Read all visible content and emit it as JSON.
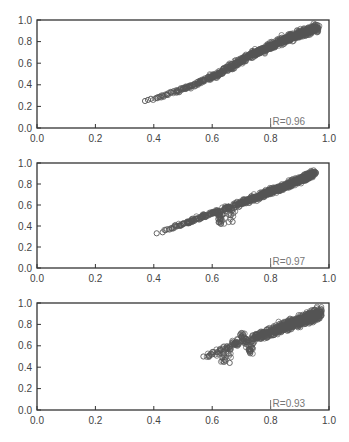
{
  "figure": {
    "panel_count": 3,
    "axis_color": "#333333",
    "marker_color": "#555555",
    "label_color": "#777777",
    "tick_color": "#333333"
  },
  "chart_data": [
    {
      "type": "scatter",
      "title": "",
      "xlabel": "",
      "ylabel": "",
      "xlim": [
        0.0,
        1.0
      ],
      "ylim": [
        0.0,
        1.0
      ],
      "x_ticks": [
        "0.0",
        "0.2",
        "0.4",
        "0.6",
        "0.8",
        "1.0"
      ],
      "y_ticks": [
        "0.0",
        "0.2",
        "0.4",
        "0.6",
        "0.8",
        "1.0"
      ],
      "grid": false,
      "legend": null,
      "marker": "open-circle",
      "annotation": "R=0.96",
      "correlation": 0.96,
      "trend": "curved (convex)",
      "x_range": [
        0.37,
        0.96
      ],
      "y_range": [
        0.25,
        0.93
      ],
      "series": [
        {
          "name": "points",
          "x": [
            0.37,
            0.38,
            0.39,
            0.41,
            0.42,
            0.43,
            0.44,
            0.46,
            0.48,
            0.5,
            0.52,
            0.54,
            0.55,
            0.57,
            0.59,
            0.6,
            0.62,
            0.64,
            0.65,
            0.67,
            0.68,
            0.7,
            0.71,
            0.72,
            0.74,
            0.75,
            0.76,
            0.78,
            0.79,
            0.8,
            0.82,
            0.83,
            0.85,
            0.86,
            0.88,
            0.89,
            0.9,
            0.92,
            0.93,
            0.95,
            0.96
          ],
          "y": [
            0.25,
            0.26,
            0.27,
            0.28,
            0.29,
            0.3,
            0.31,
            0.33,
            0.34,
            0.36,
            0.38,
            0.4,
            0.41,
            0.44,
            0.46,
            0.47,
            0.5,
            0.53,
            0.55,
            0.57,
            0.6,
            0.62,
            0.64,
            0.66,
            0.68,
            0.7,
            0.71,
            0.73,
            0.75,
            0.76,
            0.78,
            0.8,
            0.82,
            0.83,
            0.85,
            0.86,
            0.87,
            0.89,
            0.9,
            0.92,
            0.93
          ]
        }
      ]
    },
    {
      "type": "scatter",
      "title": "",
      "xlabel": "",
      "ylabel": "",
      "xlim": [
        0.0,
        1.0
      ],
      "ylim": [
        0.0,
        1.0
      ],
      "x_ticks": [
        "0.0",
        "0.2",
        "0.4",
        "0.6",
        "0.8",
        "1.0"
      ],
      "y_ticks": [
        "0.0",
        "0.2",
        "0.4",
        "0.6",
        "0.8",
        "1.0"
      ],
      "grid": false,
      "legend": null,
      "marker": "open-circle",
      "annotation": "R=0.97",
      "correlation": 0.97,
      "trend": "linear",
      "x_range": [
        0.41,
        0.95
      ],
      "y_range": [
        0.33,
        0.91
      ],
      "series": [
        {
          "name": "points",
          "x": [
            0.41,
            0.43,
            0.44,
            0.46,
            0.48,
            0.5,
            0.52,
            0.53,
            0.55,
            0.57,
            0.58,
            0.6,
            0.62,
            0.64,
            0.66,
            0.68,
            0.7,
            0.72,
            0.74,
            0.76,
            0.78,
            0.8,
            0.82,
            0.84,
            0.86,
            0.88,
            0.9,
            0.92,
            0.94,
            0.95,
            0.63,
            0.67
          ],
          "y": [
            0.33,
            0.34,
            0.36,
            0.38,
            0.4,
            0.42,
            0.44,
            0.45,
            0.47,
            0.49,
            0.5,
            0.52,
            0.54,
            0.56,
            0.58,
            0.6,
            0.62,
            0.64,
            0.66,
            0.68,
            0.71,
            0.73,
            0.75,
            0.77,
            0.79,
            0.82,
            0.84,
            0.86,
            0.89,
            0.91,
            0.42,
            0.44
          ]
        }
      ]
    },
    {
      "type": "scatter",
      "title": "",
      "xlabel": "",
      "ylabel": "",
      "xlim": [
        0.0,
        1.0
      ],
      "ylim": [
        0.0,
        1.0
      ],
      "x_ticks": [
        "0.0",
        "0.2",
        "0.4",
        "0.6",
        "0.8",
        "1.0"
      ],
      "y_ticks": [
        "0.0",
        "0.2",
        "0.4",
        "0.6",
        "0.8",
        "1.0"
      ],
      "grid": false,
      "legend": null,
      "marker": "open-circle",
      "annotation": "R=0.93",
      "correlation": 0.93,
      "trend": "linear, wider spread",
      "x_range": [
        0.57,
        0.97
      ],
      "y_range": [
        0.49,
        0.92
      ],
      "series": [
        {
          "name": "points",
          "x": [
            0.57,
            0.59,
            0.6,
            0.62,
            0.63,
            0.65,
            0.66,
            0.68,
            0.69,
            0.71,
            0.72,
            0.74,
            0.75,
            0.77,
            0.78,
            0.8,
            0.81,
            0.83,
            0.84,
            0.86,
            0.87,
            0.89,
            0.9,
            0.92,
            0.93,
            0.95,
            0.97,
            0.64,
            0.66,
            0.67,
            0.7,
            0.73
          ],
          "y": [
            0.5,
            0.51,
            0.52,
            0.54,
            0.56,
            0.57,
            0.59,
            0.61,
            0.62,
            0.64,
            0.65,
            0.67,
            0.68,
            0.7,
            0.71,
            0.73,
            0.74,
            0.76,
            0.77,
            0.79,
            0.8,
            0.82,
            0.83,
            0.85,
            0.86,
            0.88,
            0.92,
            0.45,
            0.44,
            0.63,
            0.72,
            0.53
          ]
        }
      ]
    }
  ]
}
